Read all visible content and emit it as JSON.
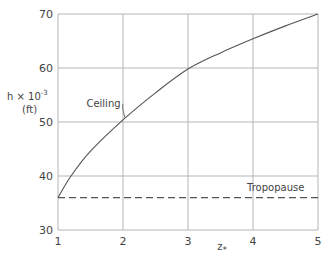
{
  "chart_data": {
    "type": "line",
    "title": "",
    "xlabel": "z*",
    "ylabel": "h × 10^-3 (ft)",
    "ylabel_line1": "h × 10",
    "ylabel_exp": "-3",
    "ylabel_line2": "(ft)",
    "xlim": [
      1,
      5
    ],
    "ylim": [
      30,
      70
    ],
    "x_ticks": [
      "1",
      "2",
      "3",
      "4",
      "5"
    ],
    "y_ticks": [
      "30",
      "40",
      "50",
      "60",
      "70"
    ],
    "grid": true,
    "legend": "none",
    "series": [
      {
        "name": "Ceiling",
        "style": "solid",
        "x": [
          1.0,
          1.2,
          1.5,
          2.0,
          2.5,
          3.0,
          3.5,
          4.0,
          4.5,
          5.0
        ],
        "values": [
          36.0,
          40.0,
          44.6,
          50.4,
          55.4,
          59.8,
          62.8,
          65.4,
          67.8,
          70.0
        ]
      },
      {
        "name": "Tropopause",
        "style": "dashed",
        "x": [
          1.0,
          5.0
        ],
        "values": [
          36.0,
          36.0
        ]
      }
    ],
    "annotations": [
      {
        "text": "Ceiling",
        "x": 1.7,
        "y": 52.8
      },
      {
        "text": "Tropopause",
        "x": 4.35,
        "y": 37.2
      }
    ]
  }
}
